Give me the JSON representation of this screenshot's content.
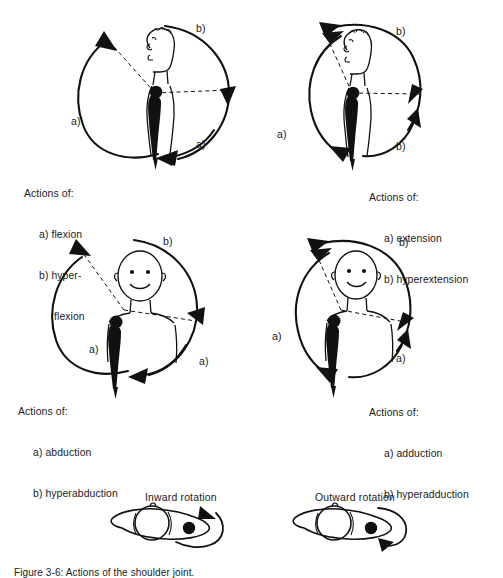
{
  "figure": {
    "caption": "Figure 3-6: Actions of the shoulder joint.",
    "panels": [
      {
        "id": "flexion",
        "view": "lateral",
        "arc_labels": [
          {
            "text": "b)",
            "pos": "top-right"
          },
          {
            "text": "a)",
            "pos": "left"
          },
          {
            "text": "a)",
            "pos": "bottom-right"
          }
        ],
        "caption": {
          "header": "Actions of:",
          "items": [
            "a) flexion",
            "b) hyper-",
            "flexion"
          ]
        }
      },
      {
        "id": "extension",
        "view": "lateral",
        "arc_labels": [
          {
            "text": "b)",
            "pos": "top-right"
          },
          {
            "text": "a)",
            "pos": "left"
          },
          {
            "text": "b)",
            "pos": "bottom-right"
          }
        ],
        "caption": {
          "header": "Actions of:",
          "items": [
            "a) extension",
            "b) hyperextension"
          ]
        }
      },
      {
        "id": "abduction",
        "view": "anterior",
        "arc_labels": [
          {
            "text": "b)",
            "pos": "top-right"
          },
          {
            "text": "a)",
            "pos": "left"
          },
          {
            "text": "a)",
            "pos": "bottom-right"
          }
        ],
        "caption": {
          "header": "Actions of:",
          "items": [
            "a) abduction",
            "b) hyperabduction"
          ]
        }
      },
      {
        "id": "adduction",
        "view": "anterior",
        "arc_labels": [
          {
            "text": "b)",
            "pos": "top-right"
          },
          {
            "text": "a)",
            "pos": "left"
          },
          {
            "text": "a)",
            "pos": "bottom-right"
          }
        ],
        "caption": {
          "header": "Actions of:",
          "items": [
            "a) adduction",
            "b) hyperadduction"
          ]
        }
      }
    ],
    "rotation": [
      {
        "id": "inward",
        "label": "Inward rotation"
      },
      {
        "id": "outward",
        "label": "Outward rotation"
      }
    ]
  },
  "style": {
    "ink": "#111111",
    "paper": "#ffffff"
  }
}
